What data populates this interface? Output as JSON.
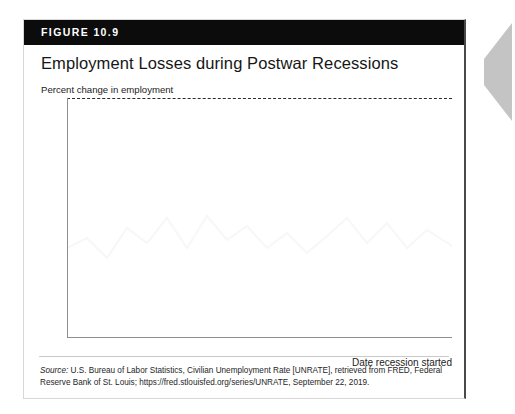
{
  "figure": {
    "label": "FIGURE 10.9",
    "title": "Employment Losses during Postwar Recessions",
    "axis_note": "Percent change in employment",
    "x_caption": "Date recession started",
    "source_word": "Source:",
    "source_text": " U.S. Bureau of Labor Statistics, Civilian Unemployment Rate [UNRATE], retrieved from FRED, Federal Reserve Bank of St. Louis; https://fred.stlouisfed.org/series/UNRATE, September 22, 2019."
  },
  "colors": {
    "header_bg": "#0c0c0c",
    "header_text": "#ffffff",
    "bar": "#b9b9b9",
    "axis": "#8e8e8e",
    "zero_line": "#2a2a2a",
    "card_border": "#d8d8d8",
    "page_edge": "#c4c4c4"
  },
  "chart_data": {
    "type": "bar",
    "title": "Employment Losses during Postwar Recessions",
    "subtitle": "",
    "xlabel": "Date recession started",
    "ylabel": "Percent change in employment",
    "xlim": [
      1940,
      2020
    ],
    "ylim": [
      -7,
      0
    ],
    "yticks": [
      0,
      -1,
      -2,
      -3,
      -4,
      -5,
      -6,
      -7
    ],
    "ytick_labels": [
      "0",
      "–1",
      "–2",
      "–3",
      "–4",
      "–5",
      "–6",
      "–7"
    ],
    "xticks": [
      1940,
      1950,
      1960,
      1970,
      1980,
      1990,
      2000,
      2010,
      2020
    ],
    "xtick_labels": [
      "1940",
      "1950",
      "1960",
      "1970",
      "1980",
      "1990",
      "2000",
      "2010",
      "2020"
    ],
    "grid": false,
    "legend": false,
    "zero_reference_line": 0,
    "x": [
      1948,
      1953,
      1957,
      1960,
      1969,
      1973,
      1980,
      1981,
      1990,
      2001,
      2007
    ],
    "values": [
      -5.0,
      -3.6,
      -4.1,
      -2.3,
      -1.5,
      -2.7,
      -1.4,
      -3.1,
      -1.5,
      -1.6,
      -6.0
    ],
    "categories": [
      "1948",
      "1953",
      "1957",
      "1960",
      "1969",
      "1973",
      "1980",
      "1981",
      "1990",
      "2001",
      "2007"
    ],
    "bar_width_years": 1.1
  }
}
